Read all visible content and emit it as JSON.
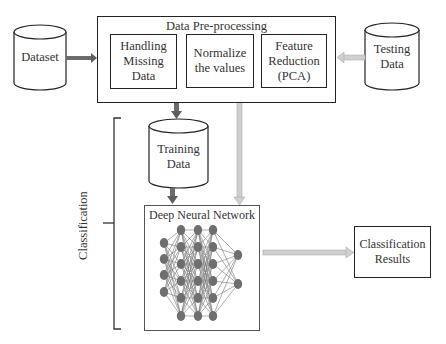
{
  "diagram": {
    "nodes": {
      "dataset": {
        "label": "Dataset",
        "shape": "cylinder"
      },
      "testing": {
        "label": "Testing\nData",
        "line1": "Testing",
        "line2": "Data",
        "shape": "cylinder"
      },
      "training": {
        "label": "Training\nData",
        "line1": "Training",
        "line2": "Data",
        "shape": "cylinder"
      },
      "preprocessing": {
        "title": "Data Pre-processing",
        "steps": [
          {
            "line1": "Handling",
            "line2": "Missing",
            "line3": "Data"
          },
          {
            "line1": "Normalize",
            "line2": "the values"
          },
          {
            "line1": "Feature",
            "line2": "Reduction",
            "line3": "(PCA)"
          }
        ]
      },
      "dnn": {
        "title": "Deep Neural Network",
        "layers": [
          4,
          6,
          6,
          6,
          2
        ]
      },
      "results": {
        "line1": "Classification",
        "line2": "Results"
      }
    },
    "group": {
      "label": "Classification"
    },
    "edges": [
      {
        "from": "dataset",
        "to": "preprocessing",
        "style": "dark"
      },
      {
        "from": "testing",
        "to": "preprocessing",
        "style": "light"
      },
      {
        "from": "preprocessing",
        "to": "training",
        "style": "dark"
      },
      {
        "from": "training",
        "to": "dnn",
        "style": "dark"
      },
      {
        "from": "preprocessing",
        "to": "dnn",
        "style": "light"
      },
      {
        "from": "dnn",
        "to": "results",
        "style": "light"
      }
    ],
    "colors": {
      "stroke": "#222222",
      "dark_arrow": "#6b6b6b",
      "light_arrow": "#c8c8c8",
      "node_fill": "#6e6e6e",
      "edge_line": "#777777"
    }
  }
}
